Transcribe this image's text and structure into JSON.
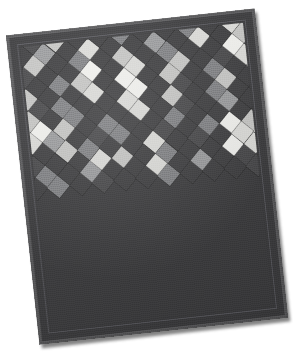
{
  "image": {
    "subject": "quilt",
    "caption": "Patchwork quilt photographed at a slight angle on a white background",
    "background_color": "#ffffff",
    "rotation_degrees": -6.2
  },
  "quilt": {
    "binding_color": "#58585a",
    "border_color": "#3b3b3d",
    "inner_stitch_line_color": "#55555a",
    "field_color": "#3c3c3e",
    "shadow_color": "#6e6e6e",
    "patch_shape": "square-on-point",
    "patch_size_px": 15.6,
    "grid_spacing_px": 22.2,
    "palette": {
      "dark": "#3d3d3f",
      "dark_alt": "#474749",
      "mid_dark": "#5d5d5f",
      "mid": "#7f8083",
      "mid_light": "#9a9b9d",
      "light": "#c6c6c4",
      "light_alt": "#dcdcd9",
      "white": "#f2f2ef"
    },
    "tone_legend": [
      {
        "key": "D",
        "name": "charcoal",
        "color": "#3d3d3f"
      },
      {
        "key": "d",
        "name": "dark-slate",
        "color": "#474749"
      },
      {
        "key": "m",
        "name": "medium-gray",
        "color": "#7f8083"
      },
      {
        "key": "g",
        "name": "light-gray",
        "color": "#9a9b9d"
      },
      {
        "key": "L",
        "name": "pale-gray",
        "color": "#c6c6c4"
      },
      {
        "key": "l",
        "name": "cream",
        "color": "#dcdcd9"
      },
      {
        "key": "W",
        "name": "white",
        "color": "#f2f2ef"
      }
    ],
    "lattice": {
      "cols": 13,
      "rows": 17,
      "rows_data": [
        "DdDDmDDdDDDdD",
        "DDmLlDDmDdLLD",
        "DLWlDDgDDWlgD",
        "DdLDDmDDmDldD",
        "DDgDlDDgDlDLD",
        "DLDmDLDmDDWDd",
        "DdDDWDlDLDdlD",
        "DDmLDWDLDmDgD",
        "DLDDlDWDdDLDD",
        "DdmDDlDLDmDDd",
        "WLDmDDlDdDgDD",
        "lWLDmDDmDDDdD",
        "DlgDdmDdDmWLD",
        "DDLmDDlDdDlWd",
        "DdDDlLDmDDWlD",
        "DmDgDDlDgDdDD",
        "DDmDdDDmDDDdD"
      ]
    }
  },
  "notes": {
    "description": "No on-screen text is present in this photograph."
  }
}
